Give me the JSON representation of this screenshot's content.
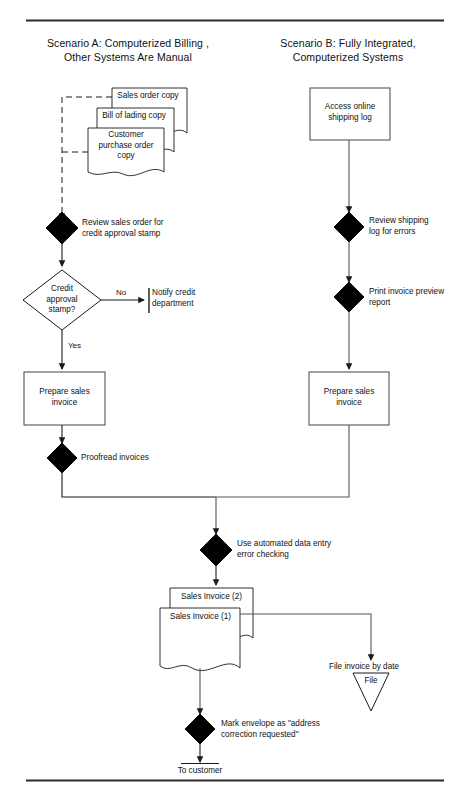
{
  "page": {
    "line_color": "#1a1a1a",
    "fill_dark": "#000000",
    "fill_light": "#ffffff"
  },
  "headings": {
    "scenario_a": "Scenario A: Computerized Billing ,\nOther Systems Are Manual",
    "scenario_b": "Scenario B: Fully Integrated,\nComputerized Systems"
  },
  "scenario_a": {
    "documents": [
      {
        "id": "sales-order-copy",
        "text": "Sales order copy"
      },
      {
        "id": "bill-of-lading-copy",
        "text": "Bill of lading copy"
      },
      {
        "id": "customer-purchase-order-copy",
        "text": "Customer\npurchase order\ncopy"
      }
    ],
    "manual_review": "Review sales order for\ncredit approval stamp",
    "decision": "Credit\napproval\nstamp?",
    "branch_no": "No",
    "branch_yes": "Yes",
    "notify": "Notify credit\ndepartment",
    "process": "Prepare sales\ninvoice",
    "proofread": "Proofread invoices"
  },
  "scenario_b": {
    "process_top": "Access online\nshipping log",
    "manual_review": "Review shipping\nlog for errors",
    "manual_print": "Print invoice preview\nreport",
    "process": "Prepare sales\ninvoice"
  },
  "shared": {
    "error_checking": "Use automated data entry\nerror checking",
    "invoice_copy_2": "Sales Invoice (2)",
    "invoice_copy_1": "Sales Invoice (1)",
    "file_label": "File invoice by date",
    "file_symbol": "File",
    "mark_envelope": "Mark envelope as \"address\ncorrection requested\"",
    "terminator": "To customer"
  }
}
